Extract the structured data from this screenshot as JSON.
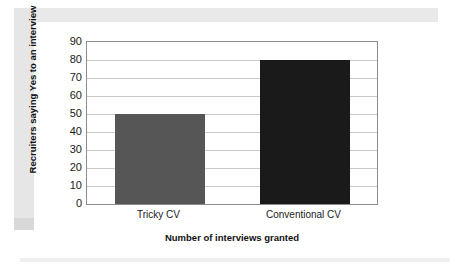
{
  "chart_data": {
    "type": "bar",
    "title": "",
    "subtitle": "",
    "categories": [
      "Tricky CV",
      "Conventional CV"
    ],
    "values": [
      50,
      80
    ],
    "bar_colors": [
      "#565656",
      "#1a1a1a"
    ],
    "xlabel": "Number of interviews granted",
    "ylabel": "Recruiters saying Yes to an interview",
    "ylim": [
      0,
      90
    ],
    "ytick_step": 10,
    "yticks": [
      90,
      80,
      70,
      60,
      50,
      40,
      30,
      20,
      10,
      0
    ],
    "grid": {
      "horizontal": true,
      "vertical": false
    },
    "legend": {
      "visible": false,
      "position": "none"
    },
    "annotations": [],
    "series": [
      {
        "name": "Recruiters saying Yes to an interview",
        "points": [
          {
            "category": "Tricky CV",
            "value": 50,
            "color": "#565656"
          },
          {
            "category": "Conventional CV",
            "value": 80,
            "color": "#1a1a1a"
          }
        ]
      }
    ]
  },
  "style": {
    "frame_color": "#8c8c8c",
    "gridline_color": "#c9c9c9",
    "plot_background": "#ffffff",
    "page_background": "#ffffff",
    "scan_edge_color": "#e9e9e9",
    "text_color": "#1a1a1a"
  }
}
